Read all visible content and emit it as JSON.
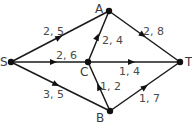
{
  "diagram": {
    "type": "network-flow",
    "nodes": [
      {
        "id": "S",
        "label": "S",
        "x": 11,
        "y": 62
      },
      {
        "id": "A",
        "label": "A",
        "x": 109,
        "y": 11
      },
      {
        "id": "C",
        "label": "C",
        "x": 88,
        "y": 62
      },
      {
        "id": "B",
        "label": "B",
        "x": 110,
        "y": 111
      },
      {
        "id": "T",
        "label": "T",
        "x": 180,
        "y": 62
      }
    ],
    "edges": [
      {
        "from": "S",
        "to": "A",
        "label": "2, 5"
      },
      {
        "from": "S",
        "to": "C",
        "label": "2, 6"
      },
      {
        "from": "S",
        "to": "B",
        "label": "3, 5"
      },
      {
        "from": "C",
        "to": "A",
        "label": "2, 4"
      },
      {
        "from": "B",
        "to": "C",
        "label": "1, 2"
      },
      {
        "from": "C",
        "to": "T",
        "label": "1, 4"
      },
      {
        "from": "A",
        "to": "T",
        "label": "2, 8"
      },
      {
        "from": "B",
        "to": "T",
        "label": "1, 7"
      }
    ],
    "colors": {
      "edge": "#1a1a1a",
      "node": "#111111",
      "label": "#4a4a4a"
    }
  }
}
